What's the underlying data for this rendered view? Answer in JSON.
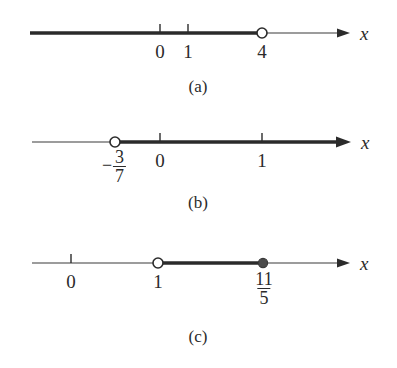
{
  "figure": {
    "axis_label": "x",
    "colors": {
      "line": "#3a3a3a",
      "highlight": "#2b2b2b",
      "background": "#ffffff",
      "open_point_fill": "#ffffff"
    }
  },
  "panels": [
    {
      "id": "a",
      "caption": "(a)",
      "axis_label": "x",
      "ticks": [
        {
          "label": "0",
          "value": 0
        },
        {
          "label": "1",
          "value": 1
        }
      ],
      "points": [
        {
          "label": "4",
          "value": 4,
          "type": "open"
        }
      ],
      "interval": {
        "notation": "(-∞, 4)",
        "direction": "left",
        "from": "-infinity",
        "to": "4",
        "endpoint_included": false
      }
    },
    {
      "id": "b",
      "caption": "(b)",
      "axis_label": "x",
      "ticks": [
        {
          "label": "0",
          "value": 0
        },
        {
          "label": "1",
          "value": 1
        }
      ],
      "points": [
        {
          "label": "-3/7",
          "numerator": "3",
          "denominator": "7",
          "sign": "−",
          "value": -0.4286,
          "type": "open"
        }
      ],
      "interval": {
        "notation": "(-3/7, ∞)",
        "direction": "right",
        "from": "-3/7",
        "to": "infinity",
        "endpoint_included": false
      }
    },
    {
      "id": "c",
      "caption": "(c)",
      "axis_label": "x",
      "ticks": [
        {
          "label": "0",
          "value": 0
        }
      ],
      "points": [
        {
          "label": "1",
          "value": 1,
          "type": "open"
        },
        {
          "label": "11/5",
          "numerator": "11",
          "denominator": "5",
          "value": 2.2,
          "type": "closed"
        }
      ],
      "interval": {
        "notation": "(1, 11/5]",
        "direction": "segment",
        "from": "1",
        "to": "11/5",
        "left_included": false,
        "right_included": true
      }
    }
  ]
}
